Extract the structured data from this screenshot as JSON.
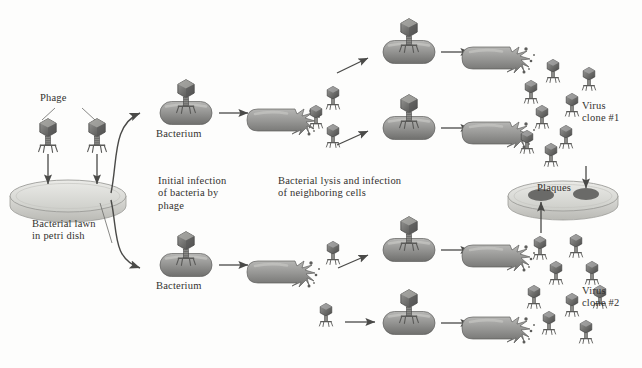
{
  "diagram": {
    "background_color": "#fdfdfc",
    "ink_color": "#33312f",
    "phage_color": "#6f6f6f",
    "bacterium_color": "#8d8d8d",
    "dish_color": "#d8d8d4",
    "plaque_color": "#6a6a68"
  },
  "labels": {
    "phage": "Phage",
    "bacterial_lawn": "Bacterial lawn\nin petri dish",
    "initial_infection": "Initial infection\nof bacteria by\nphage",
    "lysis": "Bacterial lysis and infection\nof neighboring cells",
    "bacterium_top": "Bacterium",
    "bacterium_bottom": "Bacterium",
    "plaques": "Plaques",
    "virus_clone_1": "Virus\nclone #1",
    "virus_clone_2": "Virus\nclone #2"
  },
  "elements": {
    "petri_dish": {
      "name": "bacterial-lawn-dish",
      "cx": 68,
      "cy": 196,
      "rx": 58,
      "ry": 16
    },
    "plaque_dish": {
      "name": "plaque-dish",
      "cx": 563,
      "cy": 196,
      "rx": 55,
      "ry": 15
    },
    "plaques": [
      {
        "cx": 541,
        "cy": 194,
        "rx": 13,
        "ry": 6
      },
      {
        "cx": 586,
        "cy": 194,
        "rx": 13,
        "ry": 6
      }
    ],
    "source_phages": [
      {
        "x": 48,
        "y": 128
      },
      {
        "x": 97,
        "y": 128
      }
    ],
    "infected_bacteria": [
      {
        "x": 186,
        "y": 113,
        "label": "Bacterium"
      },
      {
        "x": 186,
        "y": 265,
        "label": "Bacterium"
      },
      {
        "x": 409,
        "y": 52
      },
      {
        "x": 409,
        "y": 128
      },
      {
        "x": 409,
        "y": 250
      },
      {
        "x": 409,
        "y": 323
      }
    ],
    "lysing_bacteria": [
      {
        "x": 285,
        "y": 120
      },
      {
        "x": 285,
        "y": 272
      },
      {
        "x": 500,
        "y": 58
      },
      {
        "x": 500,
        "y": 133
      },
      {
        "x": 500,
        "y": 256
      },
      {
        "x": 500,
        "y": 328
      }
    ],
    "clone1_phage_cluster_count": 8,
    "clone2_phage_cluster_count": 9
  }
}
